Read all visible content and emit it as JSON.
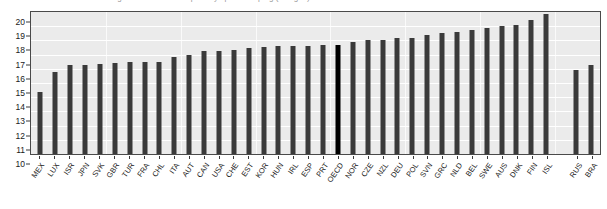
{
  "chart": {
    "title_clipped": "Average number of hours per day spent sleeping (all ages)",
    "y_ticks": [
      "20",
      "19",
      "18",
      "17",
      "16",
      "15",
      "14",
      "13",
      "12",
      "11",
      "10"
    ]
  },
  "chart_data": {
    "type": "bar",
    "title": "Average number of hours per day spent sleeping (all ages)",
    "xlabel": "",
    "ylabel": "",
    "ylim": [
      10,
      20
    ],
    "ytick_step": 1,
    "grid": true,
    "legend": "none",
    "highlight_category": "OECD",
    "highlight_color": "#000000",
    "bar_color": "#3a3a3a",
    "plot_background": "#ebebeb",
    "gridline_color": "#ffffff",
    "note": "Bars sorted ascending; a blank slot separates OECD members from the non-member economies RUS and BRA.",
    "categories": [
      "MEX",
      "LUX",
      "ISR",
      "JPN",
      "SVK",
      "GBR",
      "TUR",
      "FRA",
      "CHL",
      "ITA",
      "AUT",
      "CAN",
      "USA",
      "CHE",
      "EST",
      "KOR",
      "HUN",
      "IRL",
      "ESP",
      "PRT",
      "OECD",
      "NOR",
      "CZE",
      "NZL",
      "DEU",
      "POL",
      "SVN",
      "GRC",
      "NLD",
      "BEL",
      "SWE",
      "AUS",
      "DNK",
      "FIN",
      "ISL",
      "",
      "RUS",
      "BRA"
    ],
    "values": [
      14.4,
      15.8,
      16.25,
      16.3,
      16.35,
      16.4,
      16.45,
      16.45,
      16.5,
      16.85,
      17.0,
      17.25,
      17.25,
      17.35,
      17.5,
      17.55,
      17.6,
      17.6,
      17.6,
      17.65,
      17.7,
      17.9,
      18.0,
      18.05,
      18.15,
      18.2,
      18.35,
      18.5,
      18.6,
      18.75,
      18.9,
      19.0,
      19.1,
      19.45,
      19.85,
      null,
      15.95,
      16.25
    ]
  }
}
